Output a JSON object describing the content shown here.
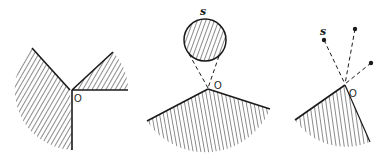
{
  "figures": [
    {
      "id": "fig1",
      "origin_label": "O",
      "description": "Two hatched wedges meeting at vertex O"
    },
    {
      "id": "fig2",
      "origin_label": "O",
      "source_label": "s",
      "description": "Hatched circular source s with dashed tangent lines to O above a hatched sector"
    },
    {
      "id": "fig3",
      "origin_label": "O",
      "source_label": "s",
      "point_count": 3,
      "description": "Three point sources with dashed lines to O above a hatched sector"
    }
  ],
  "colors": {
    "ink": "#1a1a1a",
    "background": "#ffffff"
  }
}
